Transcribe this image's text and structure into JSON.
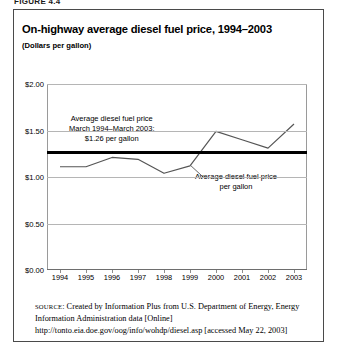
{
  "figure_label": "FIGURE 4.4",
  "title": "On-highway average diesel fuel price, 1994–2003",
  "subtitle": "(Dollars per gallon)",
  "annotations": {
    "average_line_1": "Average diesel fuel price",
    "average_line_2": "March 1994–March 2003:",
    "average_line_3": "$1.26 per gallon",
    "series_line_1": "Average diesel fuel price",
    "series_line_2": "per gallon"
  },
  "source": {
    "keyword": "SOURCE",
    "text": ": Created by Information Plus from U.S. Department of Energy, Energy Information Administration data [Online] http://tonto.eia.doe.gov/oog/info/wohdp/diesel.asp [accessed May 22, 2003]"
  },
  "chart_data": {
    "type": "line",
    "title": "On-highway average diesel fuel price, 1994–2003",
    "subtitle": "(Dollars per gallon)",
    "xlabel": "",
    "ylabel": "Dollars per gallon",
    "categories": [
      "1994",
      "1995",
      "1996",
      "1997",
      "1998",
      "1999",
      "2000",
      "2001",
      "2002",
      "2003"
    ],
    "x": [
      1994,
      1995,
      1996,
      1997,
      1998,
      1999,
      2000,
      2001,
      2002,
      2003
    ],
    "series": [
      {
        "name": "Average diesel fuel price per gallon",
        "values": [
          1.11,
          1.11,
          1.21,
          1.19,
          1.04,
          1.12,
          1.49,
          1.4,
          1.31,
          1.57
        ],
        "color": "#555555"
      }
    ],
    "reference_line": {
      "name": "Average diesel fuel price March 1994–March 2003",
      "value": 1.26,
      "color": "#000000"
    },
    "ylim": [
      0.0,
      2.0
    ],
    "yticks": [
      0.0,
      0.5,
      1.0,
      1.5,
      2.0
    ],
    "ytick_labels": [
      "$0.00",
      "$0.50",
      "$1.00",
      "$1.50",
      "$2.00"
    ],
    "grid": true,
    "legend": "none"
  }
}
